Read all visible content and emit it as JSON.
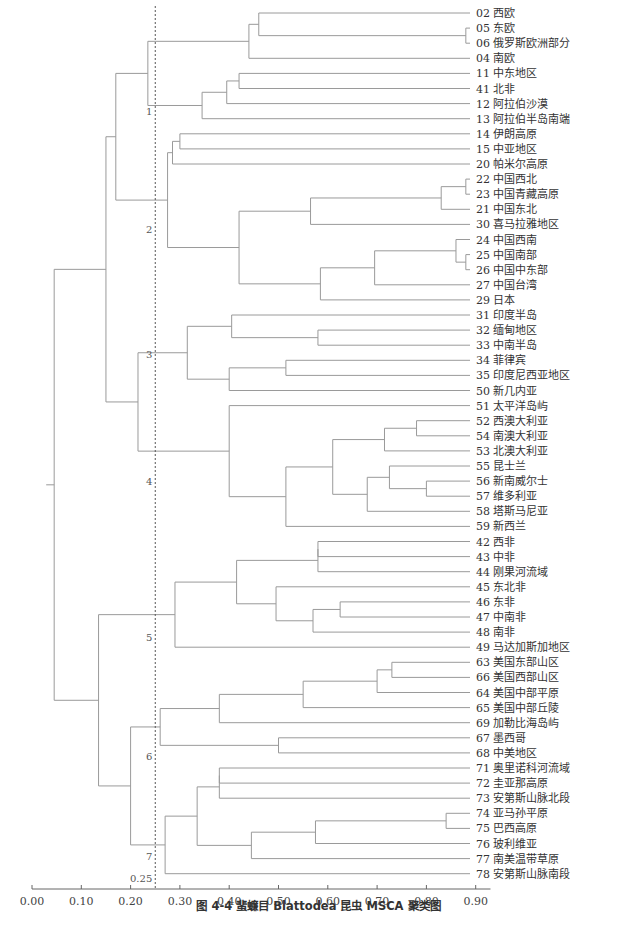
{
  "caption": "图 4-4  蜚蠊目 Blattodea 昆虫 MSCA 聚类图",
  "chart_data": {
    "type": "dendrogram",
    "title": "图 4-4  蜚蠊目 Blattodea 昆虫 MSCA 聚类图",
    "xlabel": "",
    "xlim": [
      0.0,
      0.93
    ],
    "xticks": [
      "0.00",
      "0.10",
      "0.20",
      "0.30",
      "0.40",
      "0.50",
      "0.60",
      "0.70",
      "0.80",
      "0.90"
    ],
    "cut_line": {
      "value": 0.25,
      "label": "0.25"
    },
    "cluster_labels": [
      {
        "label": "1",
        "row": 6.5
      },
      {
        "label": "2",
        "row": 14.3
      },
      {
        "label": "3",
        "row": 22.6
      },
      {
        "label": "4",
        "row": 31.0
      },
      {
        "label": "5",
        "row": 41.3
      },
      {
        "label": "6",
        "row": 49.2
      },
      {
        "label": "7",
        "row": 55.8
      }
    ],
    "leaves": [
      {
        "id": "02",
        "name": "西欧"
      },
      {
        "id": "05",
        "name": "东欧"
      },
      {
        "id": "06",
        "name": "俄罗斯欧洲部分"
      },
      {
        "id": "04",
        "name": "南欧"
      },
      {
        "id": "11",
        "name": "中东地区"
      },
      {
        "id": "41",
        "name": "北非"
      },
      {
        "id": "12",
        "name": "阿拉伯沙漠"
      },
      {
        "id": "13",
        "name": "阿拉伯半岛南端"
      },
      {
        "id": "14",
        "name": "伊朗高原"
      },
      {
        "id": "15",
        "name": "中亚地区"
      },
      {
        "id": "20",
        "name": "帕米尔高原"
      },
      {
        "id": "22",
        "name": "中国西北"
      },
      {
        "id": "23",
        "name": "中国青藏高原"
      },
      {
        "id": "21",
        "name": "中国东北"
      },
      {
        "id": "30",
        "name": "喜马拉雅地区"
      },
      {
        "id": "24",
        "name": "中国西南"
      },
      {
        "id": "25",
        "name": "中国南部"
      },
      {
        "id": "26",
        "name": "中国中东部"
      },
      {
        "id": "27",
        "name": "中国台湾"
      },
      {
        "id": "29",
        "name": "日本"
      },
      {
        "id": "31",
        "name": "印度半岛"
      },
      {
        "id": "32",
        "name": "缅甸地区"
      },
      {
        "id": "33",
        "name": "中南半岛"
      },
      {
        "id": "34",
        "name": "菲律宾"
      },
      {
        "id": "35",
        "name": "印度尼西亚地区"
      },
      {
        "id": "50",
        "name": "新几内亚"
      },
      {
        "id": "51",
        "name": "太平洋岛屿"
      },
      {
        "id": "52",
        "name": "西澳大利亚"
      },
      {
        "id": "54",
        "name": "南澳大利亚"
      },
      {
        "id": "53",
        "name": "北澳大利亚"
      },
      {
        "id": "55",
        "name": "昆士兰"
      },
      {
        "id": "56",
        "name": "新南威尔士"
      },
      {
        "id": "57",
        "name": "维多利亚"
      },
      {
        "id": "58",
        "name": "塔斯马尼亚"
      },
      {
        "id": "59",
        "name": "新西兰"
      },
      {
        "id": "42",
        "name": "西非"
      },
      {
        "id": "43",
        "name": "中非"
      },
      {
        "id": "44",
        "name": "刚果河流域"
      },
      {
        "id": "45",
        "name": "东北非"
      },
      {
        "id": "46",
        "name": "东非"
      },
      {
        "id": "47",
        "name": "中南非"
      },
      {
        "id": "48",
        "name": "南非"
      },
      {
        "id": "49",
        "name": "马达加斯加地区"
      },
      {
        "id": "63",
        "name": "美国东部山区"
      },
      {
        "id": "66",
        "name": "美国西部山区"
      },
      {
        "id": "64",
        "name": "美国中部平原"
      },
      {
        "id": "65",
        "name": "美国中部丘陵"
      },
      {
        "id": "69",
        "name": "加勒比海岛屿"
      },
      {
        "id": "67",
        "name": "墨西哥"
      },
      {
        "id": "68",
        "name": "中美地区"
      },
      {
        "id": "71",
        "name": "奥里诺科河流域"
      },
      {
        "id": "72",
        "name": "圭亚那高原"
      },
      {
        "id": "73",
        "name": "安第斯山脉北段"
      },
      {
        "id": "74",
        "name": "亚马孙平原"
      },
      {
        "id": "75",
        "name": "巴西高原"
      },
      {
        "id": "76",
        "name": "玻利维亚"
      },
      {
        "id": "77",
        "name": "南美温带草原"
      },
      {
        "id": "78",
        "name": "安第斯山脉南段"
      }
    ],
    "merges": [
      {
        "id": "a",
        "children": [
          "L1",
          "L2"
        ],
        "h": 0.88
      },
      {
        "id": "b",
        "children": [
          "L0",
          "a"
        ],
        "h": 0.46
      },
      {
        "id": "c",
        "children": [
          "b",
          "L3"
        ],
        "h": 0.44
      },
      {
        "id": "d",
        "children": [
          "L4",
          "L5"
        ],
        "h": 0.42
      },
      {
        "id": "e",
        "children": [
          "d",
          "L6"
        ],
        "h": 0.395
      },
      {
        "id": "f",
        "children": [
          "e",
          "L7"
        ],
        "h": 0.345
      },
      {
        "id": "g",
        "children": [
          "c",
          "f"
        ],
        "h": 0.235
      },
      {
        "id": "h",
        "children": [
          "L8",
          "L9"
        ],
        "h": 0.3
      },
      {
        "id": "i",
        "children": [
          "h",
          "L10"
        ],
        "h": 0.285
      },
      {
        "id": "j",
        "children": [
          "L11",
          "L12"
        ],
        "h": 0.88
      },
      {
        "id": "k",
        "children": [
          "j",
          "L13"
        ],
        "h": 0.83
      },
      {
        "id": "l",
        "children": [
          "k",
          "L14"
        ],
        "h": 0.565
      },
      {
        "id": "m",
        "children": [
          "L16",
          "L17"
        ],
        "h": 0.88
      },
      {
        "id": "n",
        "children": [
          "L15",
          "m"
        ],
        "h": 0.86
      },
      {
        "id": "o",
        "children": [
          "n",
          "L18"
        ],
        "h": 0.695
      },
      {
        "id": "p",
        "children": [
          "o",
          "L19"
        ],
        "h": 0.585
      },
      {
        "id": "q",
        "children": [
          "l",
          "p"
        ],
        "h": 0.42
      },
      {
        "id": "r",
        "children": [
          "i",
          "q"
        ],
        "h": 0.275
      },
      {
        "id": "s",
        "children": [
          "g",
          "r"
        ],
        "h": 0.17
      },
      {
        "id": "t",
        "children": [
          "L21",
          "L22"
        ],
        "h": 0.58
      },
      {
        "id": "u",
        "children": [
          "L20",
          "t"
        ],
        "h": 0.405
      },
      {
        "id": "v",
        "children": [
          "L23",
          "L24"
        ],
        "h": 0.515
      },
      {
        "id": "w",
        "children": [
          "v",
          "L25"
        ],
        "h": 0.4
      },
      {
        "id": "x",
        "children": [
          "u",
          "w"
        ],
        "h": 0.315
      },
      {
        "id": "y",
        "children": [
          "L27",
          "L28"
        ],
        "h": 0.78
      },
      {
        "id": "z",
        "children": [
          "y",
          "L29"
        ],
        "h": 0.715
      },
      {
        "id": "aa",
        "children": [
          "L31",
          "L32"
        ],
        "h": 0.8
      },
      {
        "id": "ab",
        "children": [
          "L30",
          "aa"
        ],
        "h": 0.725
      },
      {
        "id": "ac",
        "children": [
          "ab",
          "L33"
        ],
        "h": 0.68
      },
      {
        "id": "ad",
        "children": [
          "z",
          "ac"
        ],
        "h": 0.61
      },
      {
        "id": "ae",
        "children": [
          "ad",
          "L34"
        ],
        "h": 0.515
      },
      {
        "id": "af",
        "children": [
          "L26",
          "ae"
        ],
        "h": 0.4
      },
      {
        "id": "ag",
        "children": [
          "x",
          "af"
        ],
        "h": 0.215
      },
      {
        "id": "ah",
        "children": [
          "s",
          "ag"
        ],
        "h": 0.15
      },
      {
        "id": "ai",
        "children": [
          "L35",
          "L36"
        ],
        "h": 0.58
      },
      {
        "id": "aj",
        "children": [
          "ai",
          "L37"
        ],
        "h": 0.58
      },
      {
        "id": "ak",
        "children": [
          "L39",
          "L40"
        ],
        "h": 0.625
      },
      {
        "id": "al",
        "children": [
          "ak",
          "L41"
        ],
        "h": 0.57
      },
      {
        "id": "am",
        "children": [
          "L38",
          "al"
        ],
        "h": 0.495
      },
      {
        "id": "an",
        "children": [
          "aj",
          "am"
        ],
        "h": 0.415
      },
      {
        "id": "ao",
        "children": [
          "an",
          "L42"
        ],
        "h": 0.29
      },
      {
        "id": "ap",
        "children": [
          "L43",
          "L44"
        ],
        "h": 0.73
      },
      {
        "id": "aq",
        "children": [
          "ap",
          "L45"
        ],
        "h": 0.7
      },
      {
        "id": "ar",
        "children": [
          "aq",
          "L46"
        ],
        "h": 0.55
      },
      {
        "id": "as",
        "children": [
          "ar",
          "L47"
        ],
        "h": 0.38
      },
      {
        "id": "at",
        "children": [
          "L48",
          "L49"
        ],
        "h": 0.5
      },
      {
        "id": "au",
        "children": [
          "as",
          "at"
        ],
        "h": 0.26
      },
      {
        "id": "av",
        "children": [
          "L50",
          "L51"
        ],
        "h": 0.38
      },
      {
        "id": "aw",
        "children": [
          "av",
          "L52"
        ],
        "h": 0.38
      },
      {
        "id": "ax",
        "children": [
          "L53",
          "L54"
        ],
        "h": 0.84
      },
      {
        "id": "ay",
        "children": [
          "ax",
          "L55"
        ],
        "h": 0.575
      },
      {
        "id": "az",
        "children": [
          "ay",
          "L56"
        ],
        "h": 0.445
      },
      {
        "id": "ba",
        "children": [
          "aw",
          "az"
        ],
        "h": 0.335
      },
      {
        "id": "bb",
        "children": [
          "ba",
          "L57"
        ],
        "h": 0.27
      },
      {
        "id": "bc",
        "children": [
          "au",
          "bb"
        ],
        "h": 0.2
      },
      {
        "id": "bd",
        "children": [
          "ao",
          "bc"
        ],
        "h": 0.135
      },
      {
        "id": "root",
        "children": [
          "ah",
          "bd"
        ],
        "h": 0.045
      }
    ]
  }
}
